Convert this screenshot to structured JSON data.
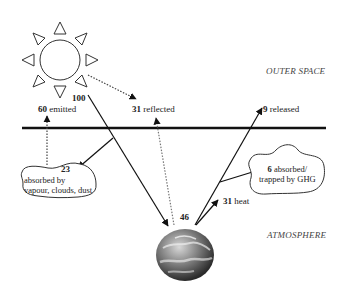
{
  "regions": {
    "outer_space": "OUTER SPACE",
    "atmosphere": "ATMOSPHERE"
  },
  "labels": {
    "incoming": {
      "value": "100",
      "text": ""
    },
    "emitted": {
      "value": "60",
      "text": "emitted"
    },
    "reflected": {
      "value": "31",
      "text": "reflected"
    },
    "released": {
      "value": "9",
      "text": "released"
    },
    "absorbed_clouds": {
      "value": "23",
      "text_line1": "absorbed by",
      "text_line2": "vapour, clouds, dust"
    },
    "absorbed_ghg": {
      "value": "6",
      "text_line1": "absorbed/",
      "text_line2": "trapped by GHG"
    },
    "heat": {
      "value": "31",
      "text": "heat"
    },
    "surface": {
      "value": "46",
      "text": ""
    }
  },
  "icons": {
    "sun": "sun-icon",
    "earth": "earth-globe-icon"
  }
}
